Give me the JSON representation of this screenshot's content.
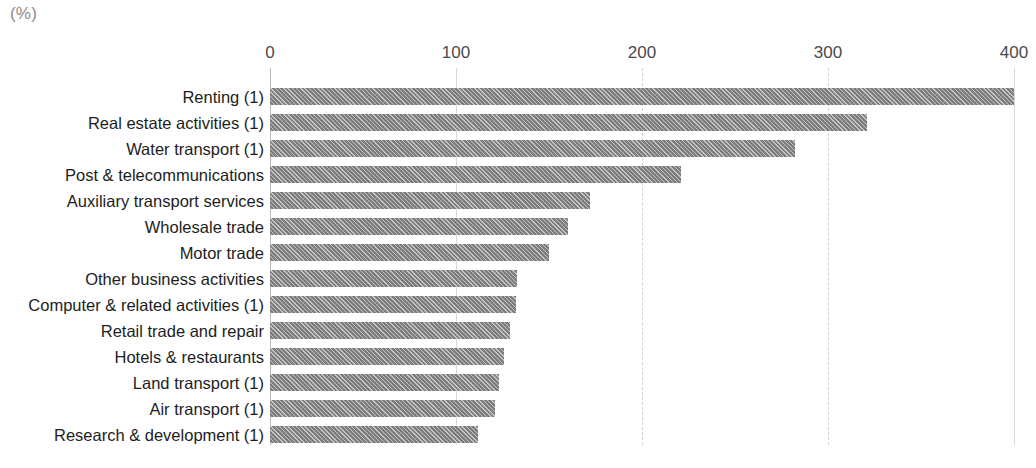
{
  "unit_label": "(%)",
  "title_remnant": "",
  "chart_data": {
    "type": "bar",
    "orientation": "horizontal",
    "title": "",
    "subtitle": "",
    "xlabel": "(%)",
    "ylabel": "",
    "xlim": [
      0,
      400
    ],
    "xticks": [
      0,
      100,
      200,
      300,
      400
    ],
    "xtick_labels": [
      "0",
      "100",
      "200",
      "300",
      "400"
    ],
    "grid": true,
    "legend": false,
    "categories": [
      "Renting (1)",
      "Real estate activities (1)",
      "Water transport (1)",
      "Post & telecommunications",
      "Auxiliary transport services",
      "Wholesale trade",
      "Motor trade",
      "Other business activities",
      "Computer & related activities (1)",
      "Retail trade and repair",
      "Hotels & restaurants",
      "Land transport (1)",
      "Air transport (1)",
      "Research & development (1)"
    ],
    "values": [
      400,
      321,
      282,
      221,
      172,
      160,
      150,
      133,
      132,
      129,
      126,
      123,
      121,
      112
    ],
    "bar_color": "#7d7d7d",
    "bar_pattern": "diagonal-hatch"
  }
}
